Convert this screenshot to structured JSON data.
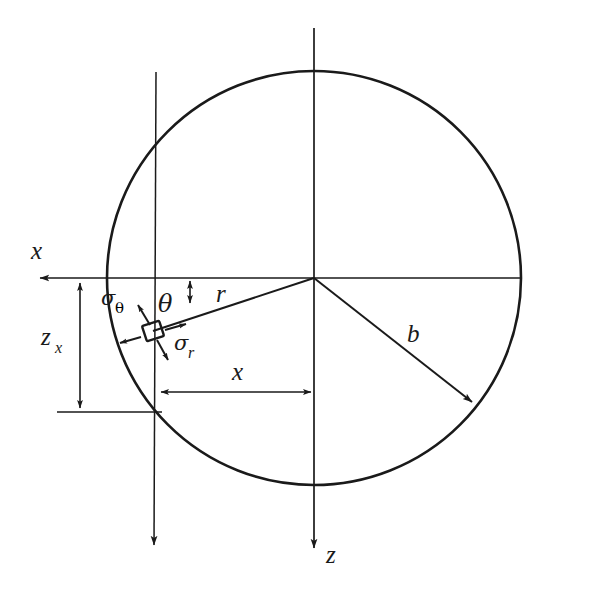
{
  "figure": {
    "kind": "engineering-diagram",
    "background_color": "#ffffff",
    "line_color": "#1a1a1a"
  },
  "labels": {
    "axis_x": "x",
    "axis_z": "z",
    "radius_b": "b",
    "radius_r": "r",
    "angle_theta": "θ",
    "depth_zx_base": "z",
    "depth_zx_sub": "x",
    "offset_x": "x",
    "stress_theta_sym": "σ",
    "stress_theta_sub": "θ",
    "stress_r_sym": "σ",
    "stress_r_sub": "r"
  },
  "geometry": {
    "circle_center_x": 314,
    "circle_center_y": 278,
    "circle_radius": 207,
    "element_point_x": 153,
    "element_point_y": 331,
    "vertical_line_x": 156,
    "horizontal_axis_y": 278,
    "dim_zx_line_x": 80,
    "dim_zx_top_y": 280,
    "dim_zx_bottom_y": 411,
    "dim_x_line_y": 392,
    "dim_x_left_x": 158,
    "dim_x_right_x": 314,
    "b_arrow_end_x": 476,
    "b_arrow_end_y": 406,
    "x_axis_arrow_end_x": 28,
    "z_axis_arrow_end_y": 560,
    "left_vertical_arrow_end_y": 556
  }
}
